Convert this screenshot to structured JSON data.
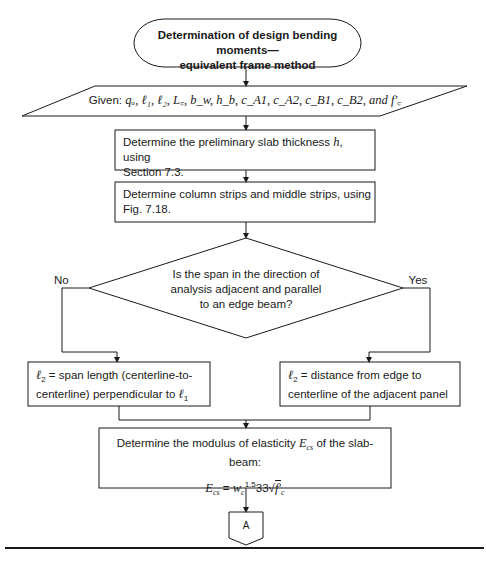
{
  "flowchart": {
    "start": {
      "line1": "Determination of design bending moments—",
      "line2": "equivalent frame method"
    },
    "given": {
      "prefix": "Given: ",
      "variables": "qᵤ, ℓ₁, ℓ₂, L꜀, b_w, h_b, c_A1, c_A2, c_B1, c_B2, and f′꜀",
      "display": "Given: q_u, ℓ1, ℓ2, L_c, b_w, h_b, c_A1, c_A2, c_B1, c_B2, and f'_c"
    },
    "step1": {
      "line1_a": "Determine the preliminary slab thickness ",
      "line1_var": "h",
      "line1_b": ", using",
      "line2": "Section 7.3."
    },
    "step2": {
      "line1": "Determine column strips and middle strips, using",
      "line2": "Fig. 7.18."
    },
    "decision": {
      "line1": "Is the span in the direction of",
      "line2": "analysis adjacent and parallel",
      "line3": "to an edge beam?",
      "no_label": "No",
      "yes_label": "Yes"
    },
    "no_branch": {
      "var": "ℓ",
      "sub": "2",
      "line1_rest": " = span length (centerline-to-",
      "line2_a": "centerline) perpendicular to ",
      "line2_var": "ℓ",
      "line2_sub": "1"
    },
    "yes_branch": {
      "var": "ℓ",
      "sub": "2",
      "line1_rest": " = distance from edge to",
      "line2": "centerline of the adjacent panel"
    },
    "modulus": {
      "line1_a": "Determine the modulus of elasticity ",
      "line1_var": "E",
      "line1_sub": "cs",
      "line1_b": " of the slab-beam:",
      "eq_lhs": "E",
      "eq_lhs_sub": "cs",
      "eq_mid": " = ",
      "eq_w": "w",
      "eq_w_sub": "c",
      "eq_w_exp": "1.5",
      "eq_const": "33",
      "eq_root": "√",
      "eq_f": "f′",
      "eq_f_sub": "c"
    },
    "connector": {
      "label": "A"
    }
  },
  "colors": {
    "line": "#1a1a1a",
    "background": "#ffffff"
  }
}
